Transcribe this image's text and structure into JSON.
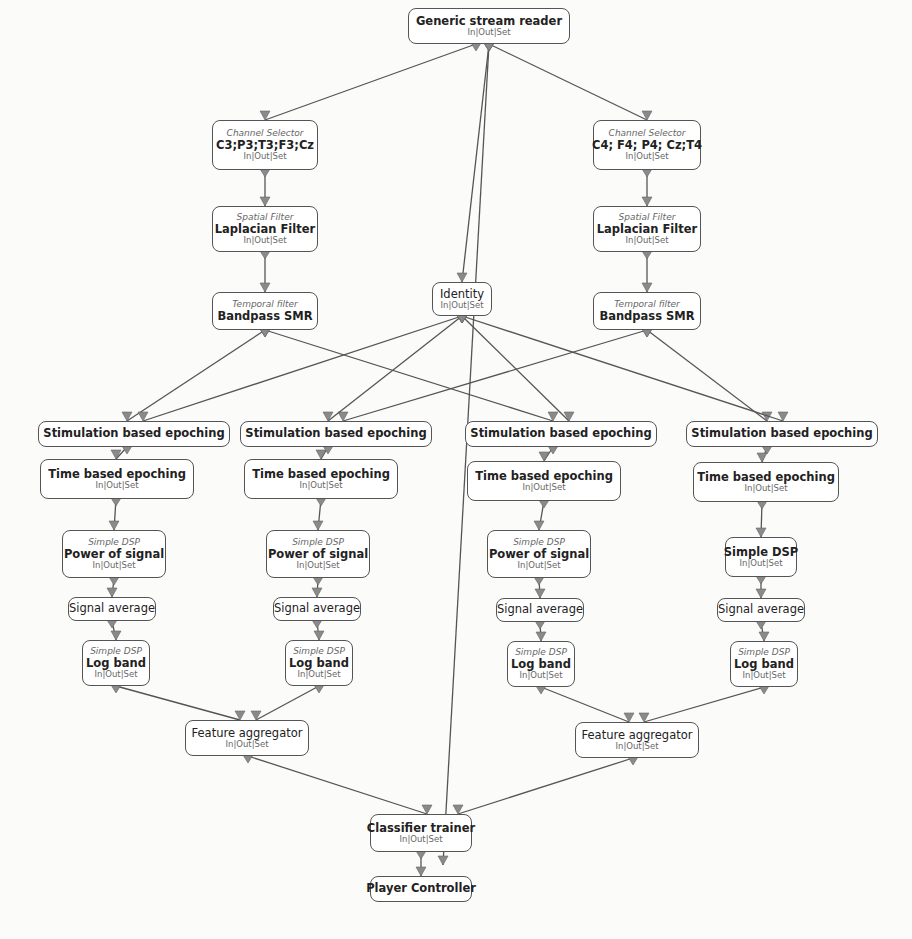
{
  "diagram": {
    "port_label": "In|Out|Set",
    "colors": {
      "background": "#fbfbfa",
      "node_border": "#555555",
      "edge": "#555555",
      "arrow": "#8a8a8a"
    },
    "nodes": [
      {
        "id": "reader",
        "kind": "",
        "name": "Generic stream reader",
        "ports": true,
        "bold": true,
        "x": 408,
        "y": 8,
        "w": 162,
        "h": 36
      },
      {
        "id": "chsel_l",
        "kind": "Channel Selector",
        "name": "C3;P3;T3;F3;Cz",
        "ports": true,
        "bold": true,
        "x": 212,
        "y": 120,
        "w": 106,
        "h": 50
      },
      {
        "id": "chsel_r",
        "kind": "Channel Selector",
        "name": "C4; F4; P4; Cz;T4",
        "ports": true,
        "bold": true,
        "x": 593,
        "y": 120,
        "w": 108,
        "h": 50
      },
      {
        "id": "spat_l",
        "kind": "Spatial Filter",
        "name": "Laplacian Filter",
        "ports": true,
        "bold": true,
        "x": 212,
        "y": 206,
        "w": 106,
        "h": 46
      },
      {
        "id": "spat_r",
        "kind": "Spatial Filter",
        "name": "Laplacian Filter",
        "ports": true,
        "bold": true,
        "x": 593,
        "y": 206,
        "w": 108,
        "h": 46
      },
      {
        "id": "identity",
        "kind": "",
        "name": "Identity",
        "ports": true,
        "bold": false,
        "x": 432,
        "y": 282,
        "w": 60,
        "h": 34
      },
      {
        "id": "temp_l",
        "kind": "Temporal filter",
        "name": "Bandpass SMR",
        "ports": false,
        "bold": true,
        "x": 212,
        "y": 292,
        "w": 106,
        "h": 38
      },
      {
        "id": "temp_r",
        "kind": "Temporal filter",
        "name": "Bandpass SMR",
        "ports": false,
        "bold": true,
        "x": 593,
        "y": 292,
        "w": 108,
        "h": 38
      },
      {
        "id": "stim1",
        "kind": "",
        "name": "Stimulation based epoching",
        "ports": false,
        "bold": true,
        "x": 38,
        "y": 421,
        "w": 192,
        "h": 26
      },
      {
        "id": "stim2",
        "kind": "",
        "name": "Stimulation based epoching",
        "ports": false,
        "bold": true,
        "x": 240,
        "y": 421,
        "w": 192,
        "h": 26
      },
      {
        "id": "stim3",
        "kind": "",
        "name": "Stimulation based epoching",
        "ports": false,
        "bold": true,
        "x": 465,
        "y": 421,
        "w": 192,
        "h": 26
      },
      {
        "id": "stim4",
        "kind": "",
        "name": "Stimulation based epoching",
        "ports": false,
        "bold": true,
        "x": 686,
        "y": 421,
        "w": 192,
        "h": 26
      },
      {
        "id": "time1",
        "kind": "",
        "name": "Time based epoching",
        "ports": true,
        "bold": true,
        "x": 40,
        "y": 459,
        "w": 154,
        "h": 40
      },
      {
        "id": "time2",
        "kind": "",
        "name": "Time based epoching",
        "ports": true,
        "bold": true,
        "x": 244,
        "y": 459,
        "w": 154,
        "h": 40
      },
      {
        "id": "time3",
        "kind": "",
        "name": "Time based epoching",
        "ports": true,
        "bold": true,
        "x": 467,
        "y": 461,
        "w": 154,
        "h": 40
      },
      {
        "id": "time4",
        "kind": "",
        "name": "Time based epoching",
        "ports": true,
        "bold": true,
        "x": 693,
        "y": 462,
        "w": 146,
        "h": 40
      },
      {
        "id": "pow1",
        "kind": "Simple DSP",
        "name": "Power of signal",
        "ports": true,
        "bold": true,
        "x": 62,
        "y": 530,
        "w": 104,
        "h": 48
      },
      {
        "id": "pow2",
        "kind": "Simple DSP",
        "name": "Power of signal",
        "ports": true,
        "bold": true,
        "x": 266,
        "y": 530,
        "w": 104,
        "h": 48
      },
      {
        "id": "pow3",
        "kind": "Simple DSP",
        "name": "Power of signal",
        "ports": true,
        "bold": true,
        "x": 487,
        "y": 530,
        "w": 104,
        "h": 48
      },
      {
        "id": "dsp4",
        "kind": "",
        "name": "Simple DSP",
        "ports": true,
        "bold": true,
        "x": 725,
        "y": 537,
        "w": 72,
        "h": 40
      },
      {
        "id": "avg1",
        "kind": "",
        "name": "Signal average",
        "ports": false,
        "bold": false,
        "x": 68,
        "y": 597,
        "w": 88,
        "h": 24
      },
      {
        "id": "avg2",
        "kind": "",
        "name": "Signal average",
        "ports": false,
        "bold": false,
        "x": 273,
        "y": 597,
        "w": 88,
        "h": 24
      },
      {
        "id": "avg3",
        "kind": "",
        "name": "Signal average",
        "ports": false,
        "bold": false,
        "x": 496,
        "y": 598,
        "w": 88,
        "h": 24
      },
      {
        "id": "avg4",
        "kind": "",
        "name": "Signal average",
        "ports": false,
        "bold": false,
        "x": 717,
        "y": 598,
        "w": 88,
        "h": 24
      },
      {
        "id": "log1",
        "kind": "Simple DSP",
        "name": "Log band",
        "ports": true,
        "bold": true,
        "x": 82,
        "y": 640,
        "w": 68,
        "h": 46
      },
      {
        "id": "log2",
        "kind": "Simple DSP",
        "name": "Log band",
        "ports": true,
        "bold": true,
        "x": 285,
        "y": 640,
        "w": 68,
        "h": 46
      },
      {
        "id": "log3",
        "kind": "Simple DSP",
        "name": "Log band",
        "ports": true,
        "bold": true,
        "x": 507,
        "y": 641,
        "w": 68,
        "h": 46
      },
      {
        "id": "log4",
        "kind": "Simple DSP",
        "name": "Log band",
        "ports": true,
        "bold": true,
        "x": 730,
        "y": 641,
        "w": 68,
        "h": 46
      },
      {
        "id": "agg_l",
        "kind": "",
        "name": "Feature aggregator",
        "ports": true,
        "bold": false,
        "x": 185,
        "y": 720,
        "w": 124,
        "h": 36
      },
      {
        "id": "agg_r",
        "kind": "",
        "name": "Feature aggregator",
        "ports": true,
        "bold": false,
        "x": 575,
        "y": 722,
        "w": 124,
        "h": 36
      },
      {
        "id": "clf",
        "kind": "",
        "name": "Classifier trainer",
        "ports": true,
        "bold": true,
        "x": 370,
        "y": 814,
        "w": 102,
        "h": 38
      },
      {
        "id": "player",
        "kind": "",
        "name": "Player Controller",
        "ports": false,
        "bold": true,
        "x": 370,
        "y": 876,
        "w": 102,
        "h": 26
      }
    ],
    "edges": [
      [
        476,
        44,
        265,
        120
      ],
      [
        489,
        44,
        647,
        120
      ],
      [
        489,
        44,
        443,
        865
      ],
      [
        265,
        170,
        265,
        206
      ],
      [
        647,
        170,
        647,
        206
      ],
      [
        265,
        252,
        265,
        292
      ],
      [
        647,
        252,
        647,
        292
      ],
      [
        489,
        44,
        462,
        282
      ],
      [
        265,
        330,
        127,
        421
      ],
      [
        265,
        330,
        553,
        421
      ],
      [
        647,
        330,
        343,
        421
      ],
      [
        647,
        330,
        767,
        421
      ],
      [
        462,
        316,
        143,
        421
      ],
      [
        462,
        316,
        328,
        421
      ],
      [
        462,
        316,
        569,
        421
      ],
      [
        462,
        316,
        783,
        421
      ],
      [
        127,
        447,
        116,
        459
      ],
      [
        328,
        447,
        321,
        459
      ],
      [
        553,
        447,
        544,
        461
      ],
      [
        767,
        447,
        762,
        462
      ],
      [
        116,
        499,
        114,
        530
      ],
      [
        321,
        499,
        318,
        530
      ],
      [
        544,
        501,
        539,
        530
      ],
      [
        762,
        502,
        761,
        537
      ],
      [
        114,
        578,
        112,
        597
      ],
      [
        318,
        578,
        317,
        597
      ],
      [
        539,
        578,
        540,
        598
      ],
      [
        761,
        577,
        761,
        598
      ],
      [
        112,
        621,
        116,
        640
      ],
      [
        317,
        621,
        319,
        640
      ],
      [
        540,
        622,
        541,
        641
      ],
      [
        761,
        622,
        764,
        641
      ],
      [
        116,
        686,
        240,
        720
      ],
      [
        319,
        686,
        256,
        720
      ],
      [
        541,
        687,
        629,
        722
      ],
      [
        764,
        687,
        644,
        722
      ],
      [
        248,
        756,
        427,
        814
      ],
      [
        633,
        758,
        458,
        814
      ],
      [
        421,
        852,
        421,
        876
      ]
    ]
  }
}
